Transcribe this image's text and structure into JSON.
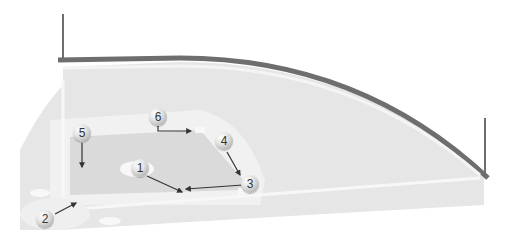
{
  "diagram": {
    "type": "baseball-field-play-diagram",
    "colors": {
      "background": "#ffffff",
      "outfield": "#e4e4e4",
      "infield_dirt": "#d9d9d9",
      "baselines": "#f4f4f4",
      "fence": "#6e6e6e",
      "arrows": "#333333"
    },
    "players": [
      {
        "number": "1",
        "x": 140,
        "y": 168
      },
      {
        "number": "2",
        "x": 45,
        "y": 219
      },
      {
        "number": "3",
        "x": 250,
        "y": 184
      },
      {
        "number": "4",
        "x": 224,
        "y": 141
      },
      {
        "number": "5",
        "x": 82,
        "y": 133
      },
      {
        "number": "6",
        "x": 158,
        "y": 117
      }
    ],
    "arrows": [
      {
        "from": "1",
        "path": "M147,176 L182,192"
      },
      {
        "from": "3",
        "path": "M243,185 L186,189"
      },
      {
        "from": "4",
        "path": "M227,152 L240,175"
      },
      {
        "from": "5",
        "path": "M82,143 L82,167"
      },
      {
        "from": "6",
        "path": "M158,125 L158,131 L191,131"
      },
      {
        "from": "2",
        "path": "M55,214 L76,203"
      }
    ]
  }
}
